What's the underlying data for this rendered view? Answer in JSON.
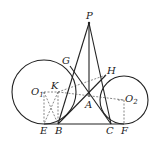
{
  "diagram": {
    "type": "geometry",
    "colors": {
      "stroke": "#222222",
      "dashed": "#555555",
      "background": "#ffffff"
    },
    "points": {
      "P": {
        "label": "P",
        "x": 89,
        "y": 23
      },
      "G": {
        "label": "G",
        "x": 70,
        "y": 66
      },
      "H": {
        "label": "H",
        "x": 106,
        "y": 75
      },
      "K": {
        "label": "K",
        "x": 58,
        "y": 92
      },
      "O1": {
        "label": "O",
        "sub": "1",
        "x": 44,
        "y": 92
      },
      "A": {
        "label": "A",
        "x": 89,
        "y": 97
      },
      "O2": {
        "label": "O",
        "sub": "2",
        "x": 124,
        "y": 100
      },
      "E": {
        "label": "E",
        "x": 44,
        "y": 124
      },
      "B": {
        "label": "B",
        "x": 58,
        "y": 124
      },
      "C": {
        "label": "C",
        "x": 111,
        "y": 124
      },
      "F": {
        "label": "F",
        "x": 124,
        "y": 124
      }
    },
    "circles": [
      {
        "name": "circle-O1",
        "cx": 44,
        "cy": 92,
        "r": 32
      },
      {
        "name": "circle-O2",
        "cx": 124,
        "cy": 100,
        "r": 24
      }
    ],
    "labels": {
      "P": "P",
      "G": "G",
      "H": "H",
      "K": "K",
      "O1": "O",
      "O1_sub": "1",
      "A": "A",
      "O2": "O",
      "O2_sub": "2",
      "E": "E",
      "B": "B",
      "C": "C",
      "F": "F"
    }
  }
}
